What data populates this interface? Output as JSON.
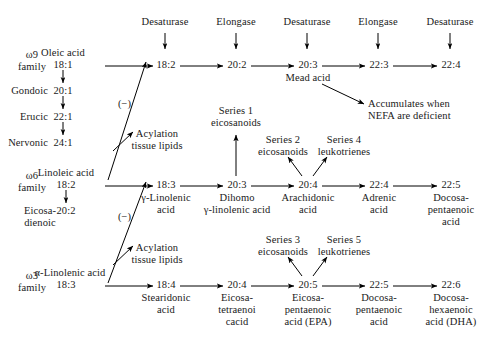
{
  "figure": {
    "text_color": "#1a1a1a",
    "background": "#ffffff",
    "line_color": "#000000"
  },
  "enzyme_headers": [
    {
      "label": "Desaturase",
      "x": 165
    },
    {
      "label": "Elongase",
      "x": 236
    },
    {
      "label": "Desaturase",
      "x": 307
    },
    {
      "label": "Elongase",
      "x": 378
    },
    {
      "label": "Desaturase",
      "x": 450
    }
  ],
  "families": {
    "omega9": {
      "family_label": "ω9\nfamily",
      "precursor_name": "Oleic acid",
      "precursor_code": "18:1",
      "side_chain": [
        {
          "name": "Gondoic",
          "code": "20:1"
        },
        {
          "name": "Erucic",
          "code": "22:1"
        },
        {
          "name": "Nervonic",
          "code": "24:1"
        }
      ],
      "nodes": [
        {
          "code": "18:2",
          "name": ""
        },
        {
          "code": "20:2",
          "name": ""
        },
        {
          "code": "20:3",
          "name": "Mead acid"
        },
        {
          "code": "22:3",
          "name": ""
        },
        {
          "code": "22:4",
          "name": ""
        }
      ],
      "annotation": "Accumulates when\nNEFA are deficient"
    },
    "omega6": {
      "family_label": "ω6\nfamily",
      "precursor_name": "Linoleic acid",
      "precursor_code": "18:2",
      "side_chain": [
        {
          "name": "Eicosa-\ndienoic",
          "code": "20:2"
        }
      ],
      "inhibition_label": "(−)",
      "acylation_label": "Acylation\ntissue lipids",
      "nodes": [
        {
          "code": "18:3",
          "name": "γ-Linolenic\nacid"
        },
        {
          "code": "20:3",
          "name": "Dihomo\nγ-linolenic acid"
        },
        {
          "code": "20:4",
          "name": "Arachidonic\nacid"
        },
        {
          "code": "22:4",
          "name": "Adrenic\nacid"
        },
        {
          "code": "22:5",
          "name": "Docosa-\npentaenoic\nacid"
        }
      ],
      "branches": [
        {
          "label": "Series 1\neicosanoids",
          "from_node": "20:3"
        },
        {
          "label": "Series 2\neicosanoids",
          "from_node": "20:4"
        },
        {
          "label": "Series 4\nleukotrienes",
          "from_node": "20:4"
        }
      ]
    },
    "omega3": {
      "family_label": "ω3\nfamily",
      "precursor_name": "α-Linolenic acid",
      "precursor_code": "18:3",
      "inhibition_label": "(−)",
      "acylation_label": "Acylation\ntissue lipids",
      "nodes": [
        {
          "code": "18:4",
          "name": "Stearidonic\nacid"
        },
        {
          "code": "20:4",
          "name": "Eicosa-\ntetraenoi\ncacid"
        },
        {
          "code": "20:5",
          "name": "Eicosa-\npentaenoic\nacid (EPA)"
        },
        {
          "code": "22:5",
          "name": "Docosa-\npentaenoic\nacid"
        },
        {
          "code": "22:6",
          "name": "Docosa-\nhexaenoic\nacid (DHA)"
        }
      ],
      "branches": [
        {
          "label": "Series 3\neicosanoids",
          "from_node": "20:5"
        },
        {
          "label": "Series 5\nleukotrienes",
          "from_node": "20:5"
        }
      ]
    }
  }
}
